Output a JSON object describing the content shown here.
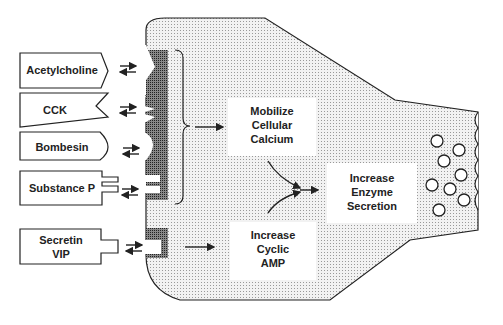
{
  "diagram": {
    "title": "",
    "receptors_ligands": [
      {
        "label": "Acetylcholine"
      },
      {
        "label": "CCK"
      },
      {
        "label": "Bombesin"
      },
      {
        "label": "Substance P"
      },
      {
        "label": "Secretin VIP",
        "lines": [
          "Secretin",
          "VIP"
        ]
      }
    ],
    "pathways": {
      "calcium": {
        "lines": [
          "Mobilize",
          "Cellular",
          "Calcium"
        ]
      },
      "camp": {
        "lines": [
          "Increase",
          "Cyclic",
          "AMP"
        ]
      },
      "secretion": {
        "lines": [
          "Increase",
          "Enzyme",
          "Secretion"
        ]
      }
    },
    "colors": {
      "cell_fill": "#d8d8d8",
      "receptor_fill": "#555555",
      "stroke": "#222222"
    }
  }
}
